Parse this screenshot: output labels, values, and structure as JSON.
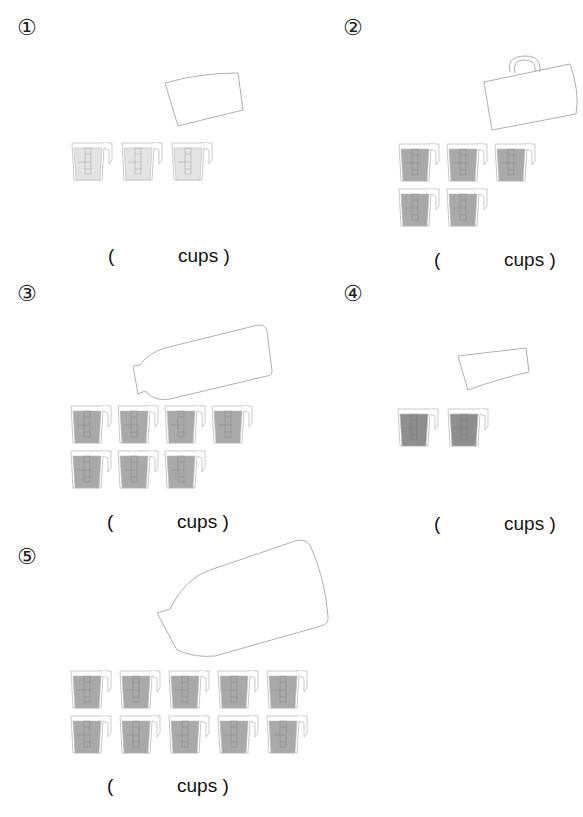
{
  "worksheet": {
    "problems": [
      {
        "number": "①",
        "container": "cup-shaped container",
        "cups_poured": 3,
        "fill_color": "#e3e3e3",
        "answer_open": "(",
        "answer_unit": "cups )"
      },
      {
        "number": "②",
        "container": "mug",
        "cups_poured": 5,
        "fill_color": "#a9a9a9",
        "answer_open": "(",
        "answer_unit": "cups )"
      },
      {
        "number": "③",
        "container": "bottle",
        "cups_poured": 7,
        "fill_color": "#a9a9a9",
        "answer_open": "(",
        "answer_unit": "cups )"
      },
      {
        "number": "④",
        "container": "glass",
        "cups_poured": 2,
        "fill_color": "#8e8e8e",
        "answer_open": "(",
        "answer_unit": "cups )"
      },
      {
        "number": "⑤",
        "container": "large bottle",
        "cups_poured": 10,
        "fill_color": "#a9a9a9",
        "answer_open": "(",
        "answer_unit": "cups )"
      }
    ],
    "colors": {
      "outline": "#9a9a9a",
      "cup_outline": "#bdbdbd",
      "mark": "#666666"
    }
  }
}
